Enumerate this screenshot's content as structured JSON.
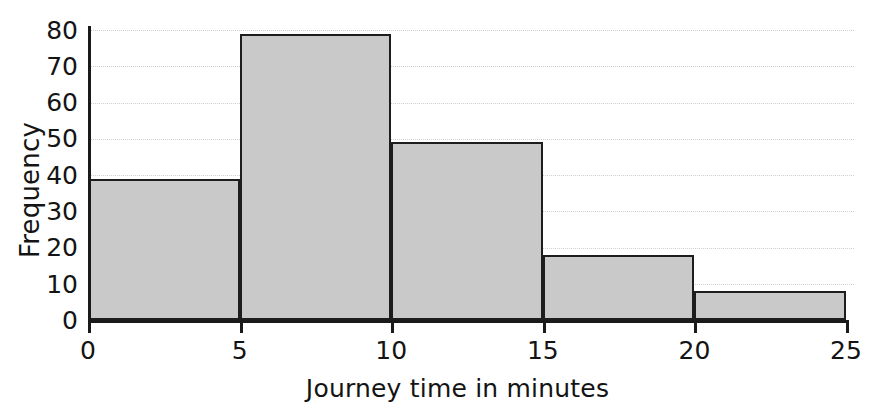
{
  "chart_data": {
    "type": "bar",
    "title": "",
    "xlabel": "Journey time in minutes",
    "ylabel": "Frequency",
    "categories": [
      "0-5",
      "5-10",
      "10-15",
      "15-20",
      "20-25"
    ],
    "bin_edges": [
      0,
      5,
      10,
      15,
      20,
      25
    ],
    "values": [
      39,
      79,
      49,
      18,
      8
    ],
    "xlim": [
      0,
      25
    ],
    "ylim": [
      0,
      80
    ],
    "xticks": [
      "0",
      "5",
      "10",
      "15",
      "20",
      "25"
    ],
    "yticks": [
      "0",
      "10",
      "20",
      "30",
      "40",
      "50",
      "60",
      "70",
      "80"
    ],
    "grid": "horizontal-dotted",
    "legend": "none",
    "bar_fill_color": "#c9c9c9",
    "bar_edge_color": "#1d1d1d",
    "axis_color": "#1a1a1a",
    "gridline_color": "#cfcfcf",
    "background_color": "#ffffff"
  }
}
